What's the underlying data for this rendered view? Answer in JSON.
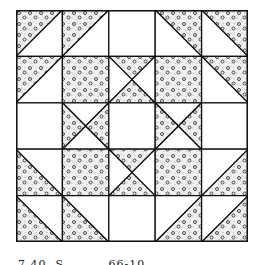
{
  "figure": {
    "grid_rows": 5,
    "grid_cols": 5,
    "colors": {
      "line": "#111111",
      "light_fabric": "#ffffff",
      "print_fabric_base": "#f3f3f3",
      "print_dot": "#333333"
    },
    "legend": {
      "plain": "solid light square",
      "print": "solid printed (dotted) square",
      "hst": "half-square triangle; 'dark' names printed corner",
      "hourglass": "quarter-square triangles; 'dark' names printed sides"
    },
    "cells": [
      [
        {
          "type": "hst",
          "dark": "tl"
        },
        {
          "type": "hst",
          "dark": "tl"
        },
        {
          "type": "plain"
        },
        {
          "type": "hst",
          "dark": "tr"
        },
        {
          "type": "hst",
          "dark": "tr"
        }
      ],
      [
        {
          "type": "hst",
          "dark": "tl"
        },
        {
          "type": "print"
        },
        {
          "type": "hourglass",
          "dark": "tb"
        },
        {
          "type": "print"
        },
        {
          "type": "hst",
          "dark": "tr"
        }
      ],
      [
        {
          "type": "plain"
        },
        {
          "type": "hourglass",
          "dark": "lr"
        },
        {
          "type": "plain"
        },
        {
          "type": "hourglass",
          "dark": "lr"
        },
        {
          "type": "plain"
        }
      ],
      [
        {
          "type": "hst",
          "dark": "bl"
        },
        {
          "type": "print"
        },
        {
          "type": "hourglass",
          "dark": "tb"
        },
        {
          "type": "print"
        },
        {
          "type": "hst",
          "dark": "br"
        }
      ],
      [
        {
          "type": "hst",
          "dark": "bl"
        },
        {
          "type": "hst",
          "dark": "bl"
        },
        {
          "type": "plain"
        },
        {
          "type": "hst",
          "dark": "br"
        },
        {
          "type": "hst",
          "dark": "br"
        }
      ]
    ]
  },
  "caption": {
    "text": "7.40. S..........66-10",
    "clipped": true
  }
}
